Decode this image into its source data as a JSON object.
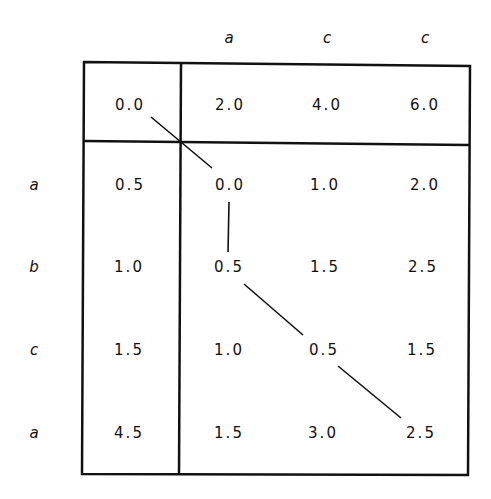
{
  "diagram": {
    "type": "edit-distance-dp-matrix",
    "column_labels": [
      "a",
      "c",
      "c"
    ],
    "row_labels": [
      "a",
      "b",
      "c",
      "a"
    ],
    "header_row": [
      "0.0",
      "2.0",
      "4.0",
      "6.0"
    ],
    "rows": [
      [
        "0.5",
        "0.0",
        "1.0",
        "2.0"
      ],
      [
        "1.0",
        "0.5",
        "1.5",
        "2.5"
      ],
      [
        "1.5",
        "1.0",
        "0.5",
        "1.5"
      ],
      [
        "4.5",
        "1.5",
        "3.0",
        "2.5"
      ]
    ],
    "path": [
      [
        0,
        0
      ],
      [
        1,
        1
      ],
      [
        2,
        1
      ],
      [
        3,
        2
      ],
      [
        4,
        3
      ]
    ]
  }
}
